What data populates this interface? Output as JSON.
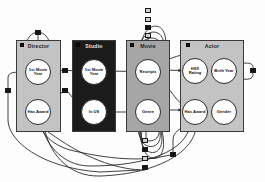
{
  "diagram": {
    "type": "relational-schema",
    "palette": {
      "light_box": "#c3c3c3",
      "mid_box": "#a6a6a6",
      "dark_box": "#1b1b1b",
      "node_fill": "#ffffff",
      "edge": "#1f1f1f",
      "marker_fill": "#2e2e2e",
      "marker_hollow": "#cfcfcf",
      "background": "#fdfdfd"
    },
    "entities": [
      {
        "id": "director",
        "label": "Director",
        "shade": "light",
        "x": 16,
        "y": 40,
        "w": 45,
        "h": 92,
        "attributes": [
          {
            "id": "director-first-movie-year",
            "label": "1st Movie Year",
            "cx": 38,
            "cy": 72,
            "r": 13
          },
          {
            "id": "director-has-award",
            "label": "Has Award",
            "cx": 38,
            "cy": 112,
            "r": 13
          }
        ]
      },
      {
        "id": "studio",
        "label": "Studio",
        "shade": "dark",
        "x": 72,
        "y": 40,
        "w": 44,
        "h": 92,
        "attributes": [
          {
            "id": "studio-first-movie-year",
            "label": "1st Movie Year",
            "cx": 94,
            "cy": 72,
            "r": 13
          },
          {
            "id": "studio-in-us",
            "label": "In US",
            "cx": 94,
            "cy": 112,
            "r": 13
          }
        ]
      },
      {
        "id": "movie",
        "label": "Movie",
        "shade": "mid",
        "x": 126,
        "y": 40,
        "w": 44,
        "h": 92,
        "attributes": [
          {
            "id": "movie-receipts",
            "label": "Receipts",
            "cx": 148,
            "cy": 72,
            "r": 13
          },
          {
            "id": "movie-genre",
            "label": "Genre",
            "cx": 148,
            "cy": 112,
            "r": 13
          }
        ]
      },
      {
        "id": "actor",
        "label": "Actor",
        "shade": "light",
        "x": 180,
        "y": 40,
        "w": 64,
        "h": 92,
        "attributes": [
          {
            "id": "actor-hsx-rating",
            "label": "HSX Rating",
            "cx": 195,
            "cy": 71,
            "r": 13
          },
          {
            "id": "actor-birth-year",
            "label": "Birth Year",
            "cx": 224,
            "cy": 71,
            "r": 13
          },
          {
            "id": "actor-has-award",
            "label": "Has Award",
            "cx": 195,
            "cy": 112,
            "r": 13
          },
          {
            "id": "actor-gender",
            "label": "Gender",
            "cx": 224,
            "cy": 112,
            "r": 13
          }
        ]
      }
    ],
    "aggregator_markers": [
      {
        "id": "marker-director-loop",
        "x": 35,
        "y": 30,
        "w": 6,
        "h": 5,
        "style": "dark"
      },
      {
        "id": "marker-director-studio-upper",
        "x": 62,
        "y": 68,
        "w": 6,
        "h": 5,
        "style": "dark"
      },
      {
        "id": "marker-director-studio-lower",
        "x": 62,
        "y": 88,
        "w": 6,
        "h": 5,
        "style": "dark"
      },
      {
        "id": "marker-left-edge",
        "x": 5,
        "y": 88,
        "w": 6,
        "h": 5,
        "style": "dark"
      },
      {
        "id": "marker-movie-top-1",
        "x": 145,
        "y": 8,
        "w": 6,
        "h": 5,
        "style": "hollow"
      },
      {
        "id": "marker-movie-top-2",
        "x": 145,
        "y": 17,
        "w": 6,
        "h": 5,
        "style": "hollow"
      },
      {
        "id": "marker-movie-top-3",
        "x": 145,
        "y": 25,
        "w": 6,
        "h": 5,
        "style": "dark"
      },
      {
        "id": "marker-movie-top-4",
        "x": 145,
        "y": 33,
        "w": 6,
        "h": 5,
        "style": "hollow"
      },
      {
        "id": "marker-movie-bottom-1",
        "x": 142,
        "y": 138,
        "w": 6,
        "h": 5,
        "style": "hollow"
      },
      {
        "id": "marker-movie-bottom-2",
        "x": 142,
        "y": 147,
        "w": 6,
        "h": 5,
        "style": "dark"
      },
      {
        "id": "marker-movie-bottom-3",
        "x": 142,
        "y": 156,
        "w": 6,
        "h": 5,
        "style": "hollow"
      },
      {
        "id": "marker-movie-bottom-4",
        "x": 142,
        "y": 165,
        "w": 6,
        "h": 5,
        "style": "dark"
      },
      {
        "id": "marker-bottom-right",
        "x": 170,
        "y": 152,
        "w": 6,
        "h": 5,
        "style": "dark"
      },
      {
        "id": "marker-actor-right-loop",
        "x": 250,
        "y": 68,
        "w": 6,
        "h": 5,
        "style": "dark"
      }
    ],
    "entity_header_dots": [
      {
        "id": "dot-director",
        "x": 20,
        "y": 43
      },
      {
        "id": "dot-studio",
        "x": 76,
        "y": 43
      },
      {
        "id": "dot-movie",
        "x": 130,
        "y": 43
      },
      {
        "id": "dot-actor",
        "x": 186,
        "y": 43
      }
    ],
    "edges": [
      {
        "id": "edge-director-selfloop",
        "from": "director-first-movie-year",
        "to": "director-first-movie-year"
      },
      {
        "id": "edge-director-year-to-award",
        "from": "director-first-movie-year",
        "to": "director-has-award"
      },
      {
        "id": "edge-director-year-to-studio",
        "from": "director-first-movie-year",
        "to": "studio-first-movie-year"
      },
      {
        "id": "edge-studio-inus-to-director-award",
        "from": "studio-in-us",
        "to": "director-has-award"
      },
      {
        "id": "edge-studio-year-to-movie-receipts",
        "from": "studio-first-movie-year",
        "to": "movie-receipts"
      },
      {
        "id": "edge-studio-inus-to-movie-genre",
        "from": "studio-in-us",
        "to": "movie-genre"
      },
      {
        "id": "edge-movie-genre-to-receipts",
        "from": "movie-genre",
        "to": "movie-receipts"
      },
      {
        "id": "edge-movie-receipts-selfloops",
        "from": "movie-receipts",
        "to": "movie-receipts"
      },
      {
        "id": "edge-movie-genre-selfloops",
        "from": "movie-genre",
        "to": "movie-genre"
      },
      {
        "id": "edge-movie-receipts-to-actor-hsx",
        "from": "movie-receipts",
        "to": "actor-hsx-rating"
      },
      {
        "id": "edge-movie-receipts-to-actor-birth",
        "from": "movie-receipts",
        "to": "actor-birth-year"
      },
      {
        "id": "edge-movie-genre-to-actor-award",
        "from": "movie-genre",
        "to": "actor-has-award"
      },
      {
        "id": "edge-actor-birth-to-gender",
        "from": "actor-birth-year",
        "to": "actor-gender"
      },
      {
        "id": "edge-actor-birth-to-award",
        "from": "actor-birth-year",
        "to": "actor-has-award"
      },
      {
        "id": "edge-actor-hsx-to-award",
        "from": "actor-hsx-rating",
        "to": "actor-has-award"
      },
      {
        "id": "edge-actor-birth-selfloop",
        "from": "actor-birth-year",
        "to": "actor-birth-year"
      },
      {
        "id": "edge-actor-award-to-director-award",
        "from": "actor-has-award",
        "to": "director-has-award"
      }
    ]
  }
}
